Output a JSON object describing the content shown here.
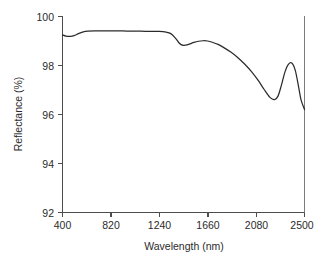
{
  "chart_data": {
    "type": "line",
    "title": "",
    "xlabel": "Wavelength (nm)",
    "ylabel": "Reflectance (%)",
    "xlim": [
      400,
      2500
    ],
    "ylim": [
      92,
      100
    ],
    "xticks": [
      400,
      820,
      1240,
      1660,
      2080,
      2500
    ],
    "xticklabels": [
      "400",
      "820",
      "1240",
      "1660",
      "2080",
      "2500"
    ],
    "yticks": [
      92,
      94,
      96,
      98,
      100
    ],
    "yticklabels": [
      "92",
      "94",
      "96",
      "98",
      "100"
    ],
    "grid": false,
    "legend": null,
    "series": [
      {
        "name": "Reflectance",
        "color": "#2b2b2b",
        "x": [
          400,
          430,
          470,
          500,
          540,
          580,
          620,
          680,
          760,
          840,
          920,
          1000,
          1080,
          1160,
          1240,
          1300,
          1340,
          1380,
          1410,
          1440,
          1470,
          1500,
          1540,
          1580,
          1620,
          1660,
          1700,
          1750,
          1800,
          1860,
          1920,
          1980,
          2040,
          2100,
          2150,
          2200,
          2240,
          2270,
          2300,
          2330,
          2360,
          2390,
          2420,
          2450,
          2470,
          2500
        ],
        "y": [
          99.25,
          99.2,
          99.19,
          99.22,
          99.3,
          99.37,
          99.4,
          99.41,
          99.41,
          99.41,
          99.41,
          99.4,
          99.4,
          99.39,
          99.39,
          99.36,
          99.3,
          99.12,
          98.93,
          98.83,
          98.83,
          98.87,
          98.94,
          98.99,
          99.01,
          99.0,
          98.95,
          98.86,
          98.73,
          98.55,
          98.33,
          98.06,
          97.75,
          97.38,
          97.02,
          96.7,
          96.61,
          96.75,
          97.2,
          97.73,
          98.05,
          98.1,
          97.8,
          97.1,
          96.6,
          96.2
        ]
      }
    ]
  },
  "axis": {
    "y_title": "Reflectance (%)",
    "x_title": "Wavelength (nm)"
  }
}
